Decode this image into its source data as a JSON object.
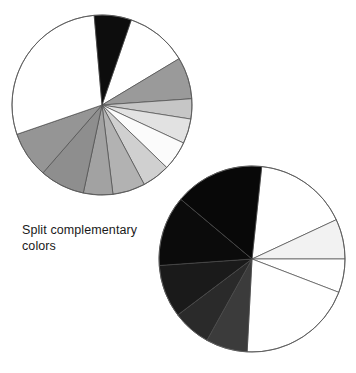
{
  "figure": {
    "title": "Split complementary colors",
    "caption_line1": "Split complementary",
    "caption_line2": "colors",
    "background_color": "#ffffff",
    "outline_color": "#5a5a5a"
  },
  "chart_data": [
    {
      "type": "pie",
      "name": "top-pie",
      "title": "Split complementary colors",
      "center": [
        102,
        105
      ],
      "radius": 90,
      "start_angle_deg": -71,
      "direction": "clockwise",
      "stroke": "#4a4a4a",
      "stroke_width": 0.7,
      "categories": [
        "wedge-1",
        "wedge-2",
        "wedge-3",
        "wedge-4",
        "wedge-5",
        "wedge-6",
        "wedge-7",
        "wedge-8",
        "wedge-9",
        "wedge-10",
        "wedge-11",
        "wedge-12"
      ],
      "values": [
        40,
        27,
        13,
        16,
        19,
        18,
        21,
        19,
        29,
        30,
        104,
        24
      ],
      "colors": [
        "#ffffff",
        "#9a9a9a",
        "#c6c6c6",
        "#e2e2e2",
        "#fbfbfb",
        "#d0d0d0",
        "#b2b2b2",
        "#a2a2a2",
        "#8e8e8e",
        "#959595",
        "#ffffff",
        "#0d0d0d"
      ],
      "xlabel": "",
      "ylabel": "",
      "legend": "none"
    },
    {
      "type": "pie",
      "name": "bottom-pie",
      "title": "Split complementary colors",
      "center": [
        252,
        259
      ],
      "radius": 93,
      "start_angle_deg": -84,
      "direction": "clockwise",
      "stroke": "#4a4a4a",
      "stroke_width": 0.7,
      "categories": [
        "wedge-1",
        "wedge-2",
        "wedge-3",
        "wedge-4",
        "wedge-5",
        "wedge-6",
        "wedge-7",
        "wedge-8",
        "wedge-9"
      ],
      "values": [
        59,
        25,
        21,
        72,
        26,
        24,
        33,
        44,
        56
      ],
      "colors": [
        "#ffffff",
        "#f2f2f2",
        "#ffffff",
        "#ffffff",
        "#3b3b3b",
        "#2a2a2a",
        "#1a1a1a",
        "#0b0b0b",
        "#080808"
      ],
      "xlabel": "",
      "ylabel": "",
      "legend": "none"
    }
  ]
}
